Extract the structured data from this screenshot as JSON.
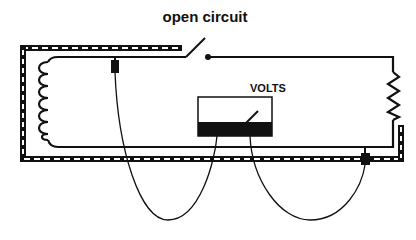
{
  "diagram": {
    "title": "open circuit",
    "meter_label": "VOLTS",
    "components": [
      {
        "id": "coil",
        "type": "inductor",
        "position": "left"
      },
      {
        "id": "switch",
        "type": "switch",
        "state": "open"
      },
      {
        "id": "resistor",
        "type": "resistor",
        "position": "right"
      },
      {
        "id": "voltmeter",
        "type": "meter",
        "label": "VOLTS"
      },
      {
        "id": "shield",
        "type": "shielded-cable"
      },
      {
        "id": "probe-left",
        "type": "probe"
      },
      {
        "id": "probe-right",
        "type": "probe"
      }
    ],
    "colors": {
      "ink": "#111111",
      "background": "#ffffff"
    }
  }
}
